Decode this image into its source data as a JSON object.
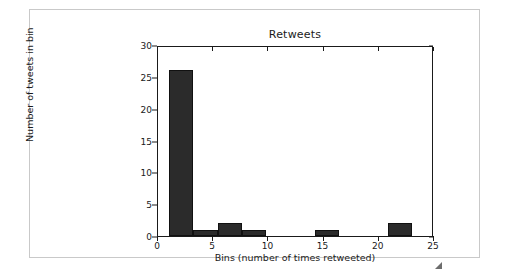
{
  "figure": {
    "background_color": "#ffffff",
    "frame_color": "#c9c9c9",
    "axes_color": "#1a1a1a",
    "bar_color": "#2b2b2b"
  },
  "resize_handle": {
    "name": "resize-handle"
  },
  "chart_data": {
    "type": "bar",
    "title": "Retweets",
    "xlabel": "Bins (number of times retweeted)",
    "ylabel": "Number of tweets in bin",
    "grid": false,
    "legend": null,
    "xlim": [
      0,
      25
    ],
    "ylim": [
      0,
      30
    ],
    "xticks": [
      0,
      5,
      10,
      15,
      20,
      25
    ],
    "xtick_labels": [
      "0",
      "5",
      "10",
      "15",
      "20",
      "25"
    ],
    "yticks": [
      0,
      5,
      10,
      15,
      20,
      25,
      30
    ],
    "ytick_labels": [
      "0",
      "5",
      "10",
      "15",
      "20",
      "25",
      "30"
    ],
    "bin_edges": [
      1,
      3.2,
      5.4,
      7.6,
      9.8,
      12,
      14.2,
      16.4,
      18.6,
      20.8,
      23
    ],
    "bin_width": 2.2,
    "categories": [
      "1-3.2",
      "3.2-5.4",
      "5.4-7.6",
      "7.6-9.8",
      "9.8-12",
      "12-14.2",
      "14.2-16.4",
      "16.4-18.6",
      "18.6-20.8",
      "20.8-23"
    ],
    "values": [
      26,
      1,
      2,
      1,
      0,
      0,
      1,
      0,
      0,
      2
    ],
    "bars": [
      {
        "x0": 1,
        "x1": 3.2,
        "value": 26
      },
      {
        "x0": 3.2,
        "x1": 5.4,
        "value": 1
      },
      {
        "x0": 5.4,
        "x1": 7.6,
        "value": 2
      },
      {
        "x0": 7.6,
        "x1": 9.8,
        "value": 1
      },
      {
        "x0": 9.8,
        "x1": 12,
        "value": 0
      },
      {
        "x0": 12,
        "x1": 14.2,
        "value": 0
      },
      {
        "x0": 14.2,
        "x1": 16.4,
        "value": 1
      },
      {
        "x0": 16.4,
        "x1": 18.6,
        "value": 0
      },
      {
        "x0": 18.6,
        "x1": 20.8,
        "value": 0
      },
      {
        "x0": 20.8,
        "x1": 23,
        "value": 2
      }
    ]
  }
}
